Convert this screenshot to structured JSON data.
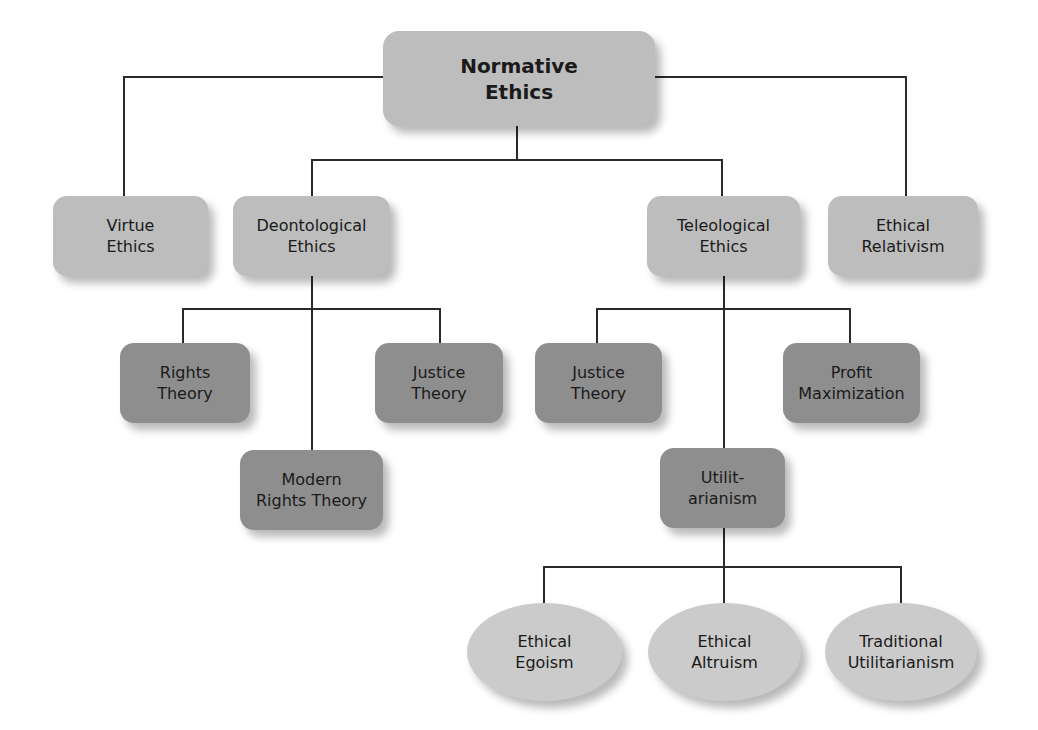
{
  "diagram": {
    "title": "Normative Ethics",
    "colors": {
      "level1_fill": "#bdbdbd",
      "level2_fill": "#8e8e8e",
      "leaf_fill": "#cbcbcb",
      "connector": "#2a2a2a",
      "text": "#1a1a1a"
    },
    "nodes": {
      "root": {
        "line1": "Normative",
        "line2": "Ethics"
      },
      "virtue": {
        "line1": "Virtue",
        "line2": "Ethics"
      },
      "deontological": {
        "line1": "Deontological",
        "line2": "Ethics"
      },
      "teleological": {
        "line1": "Teleological",
        "line2": "Ethics"
      },
      "relativism": {
        "line1": "Ethical",
        "line2": "Relativism"
      },
      "rights_theory": {
        "line1": "Rights",
        "line2": "Theory"
      },
      "justice_theory_deon": {
        "line1": "Justice",
        "line2": "Theory"
      },
      "modern_rights": {
        "line1": "Modern",
        "line2": "Rights Theory"
      },
      "justice_theory_tele": {
        "line1": "Justice",
        "line2": "Theory"
      },
      "profit_max": {
        "line1": "Profit",
        "line2": "Maximization"
      },
      "utilitarianism": {
        "line1": "Utilit-",
        "line2": "arianism"
      },
      "egoism": {
        "line1": "Ethical",
        "line2": "Egoism"
      },
      "altruism": {
        "line1": "Ethical",
        "line2": "Altruism"
      },
      "traditional_util": {
        "line1": "Traditional",
        "line2": "Utilitarianism"
      }
    },
    "edges": [
      [
        "Normative Ethics",
        "Virtue Ethics"
      ],
      [
        "Normative Ethics",
        "Deontological Ethics"
      ],
      [
        "Normative Ethics",
        "Teleological Ethics"
      ],
      [
        "Normative Ethics",
        "Ethical Relativism"
      ],
      [
        "Deontological Ethics",
        "Rights Theory"
      ],
      [
        "Deontological Ethics",
        "Justice Theory"
      ],
      [
        "Deontological Ethics",
        "Modern Rights Theory"
      ],
      [
        "Teleological Ethics",
        "Justice Theory"
      ],
      [
        "Teleological Ethics",
        "Profit Maximization"
      ],
      [
        "Teleological Ethics",
        "Utilitarianism"
      ],
      [
        "Utilitarianism",
        "Ethical Egoism"
      ],
      [
        "Utilitarianism",
        "Ethical Altruism"
      ],
      [
        "Utilitarianism",
        "Traditional Utilitarianism"
      ]
    ]
  }
}
